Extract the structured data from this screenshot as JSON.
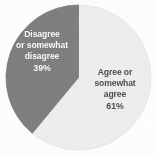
{
  "chart_data": {
    "type": "pie",
    "title": "",
    "subtitle": "",
    "xlabel": "",
    "ylabel": "",
    "legend_position": "none",
    "grid": false,
    "labels_inside": true,
    "categories": [
      "Agree or somewhat agree",
      "Disagree or somewhat disagree"
    ],
    "values": [
      61,
      39
    ],
    "value_unit": "%",
    "slices": [
      {
        "name": "Agree or somewhat agree",
        "label_line_1": "Agree or",
        "label_line_2": "somewhat",
        "label_line_3": "agree",
        "value": 61,
        "value_label": "61%",
        "color": "#efefef",
        "text_color": "#4f4f4f",
        "start_angle_deg": 0,
        "end_angle_deg": 219.6
      },
      {
        "name": "Disagree or somewhat disagree",
        "label_line_1": "Disagree",
        "label_line_2": "or somewhat",
        "label_line_3": "disagree",
        "value": 39,
        "value_label": "39%",
        "color": "#808080",
        "text_color": "#ffffff",
        "start_angle_deg": 219.6,
        "end_angle_deg": 360
      }
    ]
  },
  "labels": {
    "disagree": {
      "line1": "Disagree",
      "line2": "or somewhat",
      "line3": "disagree",
      "value": "39%"
    },
    "agree": {
      "line1": "Agree or",
      "line2": "somewhat",
      "line3": "agree",
      "value": "61%"
    }
  },
  "colors": {
    "background": "#ffffff",
    "slice_dark": "#808080",
    "slice_light": "#efefef",
    "slice_light_edge": "#e2e2e2",
    "label_light_text": "#ffffff",
    "label_dark_text": "#4f4f4f"
  }
}
